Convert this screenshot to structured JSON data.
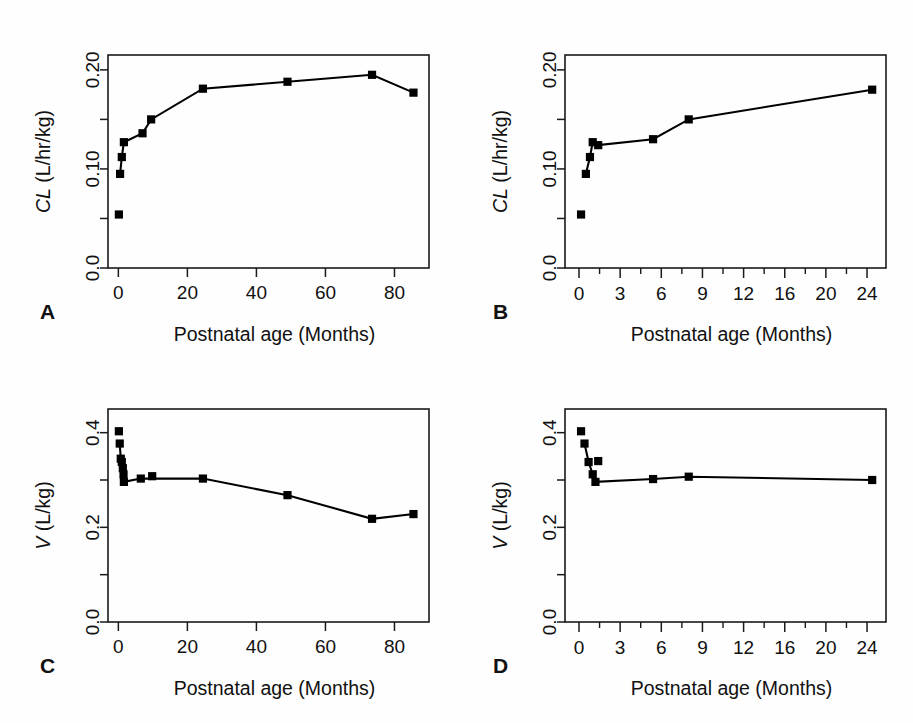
{
  "figure": {
    "title": "",
    "background_color": "#ffffff",
    "line_color": "#000000",
    "marker_color": "#000000",
    "panel_count": 4
  },
  "panels": [
    {
      "letter": "A",
      "xlabel": "Postnatal age (Months)",
      "ylabel_italic": "CL",
      "ylabel_rest": " (L/hr/kg)"
    },
    {
      "letter": "B",
      "xlabel": "Postnatal age (Months)",
      "ylabel_italic": "CL",
      "ylabel_rest": " (L/hr/kg)"
    },
    {
      "letter": "C",
      "xlabel": "Postnatal age (Months)",
      "ylabel_italic": "V",
      "ylabel_rest": " (L/kg)"
    },
    {
      "letter": "D",
      "xlabel": "Postnatal age (Months)",
      "ylabel_italic": "V",
      "ylabel_rest": " (L/kg)"
    }
  ],
  "chart_data": [
    {
      "panel": "A",
      "type": "line",
      "title": "",
      "xlabel": "Postnatal age (Months)",
      "ylabel": "CL (L/hr/kg)",
      "xlim": [
        -3,
        90
      ],
      "ylim": [
        0.0,
        0.215
      ],
      "xticks": [
        0,
        20,
        40,
        60,
        80
      ],
      "xticklabels": [
        "0",
        "20",
        "40",
        "60",
        "80"
      ],
      "x_tick_scale": "linear",
      "yticks": [
        0.0,
        0.05,
        0.1,
        0.15,
        0.2
      ],
      "yticklabels": [
        "0.0",
        "",
        "0.10",
        "",
        "0.20"
      ],
      "grid": false,
      "legend": "none",
      "x": [
        0.15,
        0.5,
        1.0,
        1.6,
        7.0,
        9.5,
        24.5,
        49.0,
        73.5,
        85.5
      ],
      "y": [
        0.054,
        0.095,
        0.112,
        0.127,
        0.136,
        0.15,
        0.181,
        0.188,
        0.195,
        0.177
      ],
      "line_from_index": 1,
      "unconnected_points": [
        {
          "x": 0.15,
          "y": 0.054
        }
      ]
    },
    {
      "panel": "B",
      "type": "line",
      "title": "",
      "xlabel": "Postnatal age (Months)",
      "ylabel": "CL (L/hr/kg)",
      "ylim": [
        0.0,
        0.215
      ],
      "x_tick_scale": "ordinal-uneven",
      "xticks": [
        0,
        3,
        6,
        9,
        12,
        16,
        20,
        24
      ],
      "xticklabels": [
        "0",
        "3",
        "6",
        "9",
        "12",
        "16",
        "20",
        "24"
      ],
      "yticks": [
        0.0,
        0.05,
        0.1,
        0.15,
        0.2
      ],
      "yticklabels": [
        "0.0",
        "",
        "0.10",
        "",
        "0.20"
      ],
      "grid": false,
      "legend": "none",
      "x": [
        0.15,
        0.5,
        0.8,
        1.0,
        1.4,
        5.4,
        8.0,
        24.5
      ],
      "y": [
        0.054,
        0.095,
        0.112,
        0.127,
        0.124,
        0.13,
        0.15,
        0.18
      ],
      "line_from_index": 1,
      "unconnected_points": [
        {
          "x": 0.15,
          "y": 0.054
        }
      ]
    },
    {
      "panel": "C",
      "type": "line",
      "title": "",
      "xlabel": "Postnatal age (Months)",
      "ylabel": "V (L/kg)",
      "xlim": [
        -3,
        90
      ],
      "ylim": [
        0.0,
        0.45
      ],
      "xticks": [
        0,
        20,
        40,
        60,
        80
      ],
      "xticklabels": [
        "0",
        "20",
        "40",
        "60",
        "80"
      ],
      "x_tick_scale": "linear",
      "yticks": [
        0.0,
        0.1,
        0.2,
        0.3,
        0.4
      ],
      "yticklabels": [
        "0.0",
        "",
        "0.2",
        "",
        "0.4"
      ],
      "grid": false,
      "legend": "none",
      "x": [
        0.15,
        0.4,
        0.7,
        1.0,
        1.3,
        1.5,
        1.6,
        6.5,
        9.8,
        24.5,
        49.0,
        73.5,
        85.5
      ],
      "y": [
        0.403,
        0.377,
        0.345,
        0.338,
        0.325,
        0.312,
        0.296,
        0.303,
        0.308,
        0.303,
        0.268,
        0.218,
        0.228
      ],
      "line_from_index": 1,
      "unconnected_points": [
        {
          "x": 0.15,
          "y": 0.403
        },
        {
          "x": 0.25,
          "y": 0.296
        },
        {
          "x": 9.8,
          "y": 0.308
        }
      ]
    },
    {
      "panel": "D",
      "type": "line",
      "title": "",
      "xlabel": "Postnatal age (Months)",
      "ylabel": "V (L/kg)",
      "ylim": [
        0.0,
        0.45
      ],
      "x_tick_scale": "ordinal-uneven",
      "xticks": [
        0,
        3,
        6,
        9,
        12,
        16,
        20,
        24
      ],
      "xticklabels": [
        "0",
        "3",
        "6",
        "9",
        "12",
        "16",
        "20",
        "24"
      ],
      "yticks": [
        0.0,
        0.1,
        0.2,
        0.3,
        0.4
      ],
      "yticklabels": [
        "0.0",
        "",
        "0.2",
        "",
        "0.4"
      ],
      "grid": false,
      "legend": "none",
      "x": [
        0.15,
        0.4,
        0.7,
        1.0,
        1.2,
        1.4,
        5.4,
        8.0,
        24.5
      ],
      "y": [
        0.403,
        0.377,
        0.338,
        0.312,
        0.296,
        0.34,
        0.302,
        0.307,
        0.3
      ],
      "line_from_index": 1,
      "unconnected_points": [
        {
          "x": 0.15,
          "y": 0.403
        },
        {
          "x": 1.0,
          "y": 0.296
        },
        {
          "x": 1.4,
          "y": 0.34
        }
      ]
    }
  ]
}
